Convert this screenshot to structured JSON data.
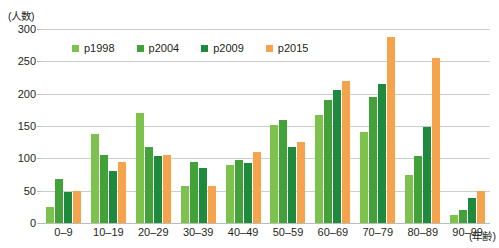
{
  "chart_data": {
    "type": "bar",
    "title": "",
    "xlabel": "(年齢)",
    "ylabel": "(人数)",
    "ylim": [
      0,
      300
    ],
    "yticks": [
      0,
      50,
      100,
      150,
      200,
      250,
      300
    ],
    "grid": true,
    "legend_position": "top-left-inside",
    "categories": [
      "0–9",
      "10–19",
      "20–29",
      "30–39",
      "40–49",
      "50–59",
      "60–69",
      "70–79",
      "80–89",
      "90–99"
    ],
    "series": [
      {
        "name": "p1998",
        "color": "#7cc24d",
        "values": [
          25,
          137,
          170,
          57,
          90,
          152,
          167,
          140,
          75,
          13
        ]
      },
      {
        "name": "p2004",
        "color": "#43a13a",
        "values": [
          68,
          105,
          118,
          95,
          97,
          160,
          190,
          195,
          103,
          20
        ]
      },
      {
        "name": "p2009",
        "color": "#1d8a3e",
        "values": [
          48,
          80,
          103,
          85,
          93,
          118,
          205,
          215,
          148,
          38
        ]
      },
      {
        "name": "p2015",
        "color": "#f5a44b",
        "values": [
          50,
          95,
          105,
          58,
          110,
          125,
          220,
          287,
          255,
          50
        ]
      }
    ]
  }
}
